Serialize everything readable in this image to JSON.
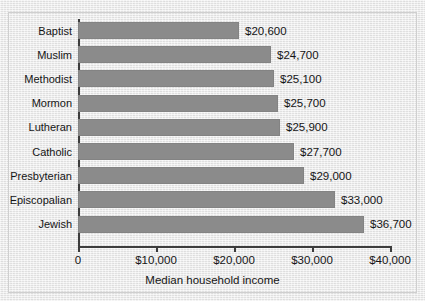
{
  "figure": {
    "top_caption": "",
    "background_color": "#ececec",
    "bar_color": "#8b8b8b",
    "axis_color": "#3c3c3c",
    "text_color": "#151515",
    "frame_border_color": "#cfcfcf"
  },
  "chart_data": {
    "type": "bar",
    "orientation": "horizontal",
    "title": "",
    "xlabel": "Median household income",
    "ylabel": "",
    "categories": [
      "Baptist",
      "Muslim",
      "Methodist",
      "Mormon",
      "Lutheran",
      "Catholic",
      "Presbyterian",
      "Episcopalian",
      "Jewish"
    ],
    "values": [
      20600,
      24700,
      25100,
      25700,
      25900,
      27700,
      29000,
      33000,
      36700
    ],
    "value_labels": [
      "$20,600",
      "$24,700",
      "$25,100",
      "$25,700",
      "$25,900",
      "$27,700",
      "$29,000",
      "$33,000",
      "$36,700"
    ],
    "xlim": [
      0,
      40000
    ],
    "xticks": [
      0,
      10000,
      20000,
      30000,
      40000
    ],
    "xtick_labels": [
      "0",
      "$10,000",
      "$20,000",
      "$30,000",
      "$40,000"
    ],
    "grid": false,
    "legend": null
  }
}
